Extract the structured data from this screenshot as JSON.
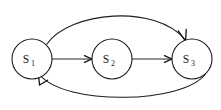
{
  "diagram": {
    "type": "state-transition-diagram",
    "title": "",
    "background_color": "#ffffff",
    "stroke_color": "#1c1c1c",
    "label_color": "#1c1c1c",
    "canvas": {
      "width": 221,
      "height": 110
    },
    "nodes": [
      {
        "id": "s1",
        "label_base": "S",
        "label_subscript": "1",
        "label_full": "S1",
        "cx": 32,
        "cy": 59,
        "r": 20
      },
      {
        "id": "s2",
        "label_base": "S",
        "label_subscript": "2",
        "label_full": "S2",
        "cx": 112,
        "cy": 59,
        "r": 20
      },
      {
        "id": "s3",
        "label_base": "S",
        "label_subscript": "3",
        "label_full": "S3",
        "cx": 192,
        "cy": 59,
        "r": 20
      }
    ],
    "edges": [
      {
        "id": "e1",
        "from": "s1",
        "to": "s2",
        "shape": "straight",
        "label": "",
        "directed": true
      },
      {
        "id": "e2",
        "from": "s2",
        "to": "s3",
        "shape": "straight",
        "label": "",
        "directed": true
      },
      {
        "id": "e3",
        "from": "s1",
        "to": "s3",
        "shape": "arc-above",
        "label": "",
        "directed": true
      },
      {
        "id": "e4",
        "from": "s3",
        "to": "s1",
        "shape": "arc-below",
        "label": "",
        "directed": true
      }
    ]
  }
}
